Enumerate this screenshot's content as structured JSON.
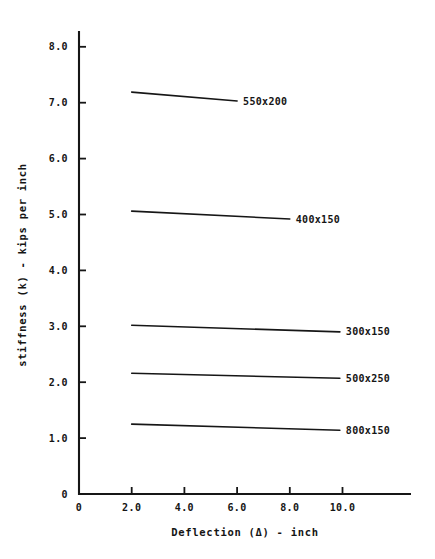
{
  "chart_data": {
    "type": "line",
    "title": "",
    "xlabel": "Deflection (Δ) - inch",
    "ylabel": "stiffness (k) - kips per inch",
    "xlim": [
      0,
      11.5
    ],
    "ylim": [
      0,
      8.6
    ],
    "grid": false,
    "legend_position": "right-inline-labels",
    "x_ticks": [
      {
        "value": 0,
        "label": "0"
      },
      {
        "value": 2,
        "label": "2.0"
      },
      {
        "value": 4,
        "label": "4.0"
      },
      {
        "value": 6,
        "label": "6.0"
      },
      {
        "value": 8,
        "label": "8.0"
      },
      {
        "value": 10,
        "label": "10.0"
      }
    ],
    "y_ticks": [
      {
        "value": 0,
        "label": "0"
      },
      {
        "value": 1,
        "label": "1.0"
      },
      {
        "value": 2,
        "label": "2.0"
      },
      {
        "value": 3,
        "label": "3.0"
      },
      {
        "value": 4,
        "label": "4.0"
      },
      {
        "value": 5,
        "label": "5.0"
      },
      {
        "value": 6,
        "label": "6.0"
      },
      {
        "value": 7,
        "label": "7.0"
      },
      {
        "value": 8,
        "label": "8.0"
      }
    ],
    "series": [
      {
        "name": "550x200",
        "x": [
          2.0,
          6.0
        ],
        "values": [
          7.19,
          7.03
        ]
      },
      {
        "name": "400x150",
        "x": [
          2.0,
          8.0
        ],
        "values": [
          5.06,
          4.92
        ]
      },
      {
        "name": "300x150",
        "x": [
          2.0,
          9.9
        ],
        "values": [
          3.02,
          2.9
        ]
      },
      {
        "name": "500x250",
        "x": [
          2.0,
          9.9
        ],
        "values": [
          2.16,
          2.07
        ]
      },
      {
        "name": "800x150",
        "x": [
          2.0,
          9.9
        ],
        "values": [
          1.25,
          1.14
        ]
      }
    ]
  },
  "colors": {
    "ink": "#161616",
    "paper": "#ffffff"
  }
}
